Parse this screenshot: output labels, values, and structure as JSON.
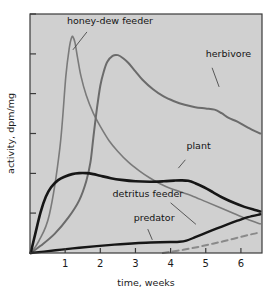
{
  "chart_data": {
    "type": "line",
    "title": "",
    "xlabel": "time, weeks",
    "ylabel": "activity, dpm/mg",
    "xlim": [
      0,
      6.6
    ],
    "ylim": [
      0,
      100
    ],
    "grid": false,
    "legend_position": "inline-annotations",
    "xticks": [
      "1",
      "2",
      "3",
      "4",
      "5",
      "6"
    ],
    "xtick_values": [
      1,
      2,
      3,
      4,
      5,
      6
    ],
    "ytick_values": [
      0,
      16.7,
      33.3,
      50,
      66.7,
      83.3,
      100
    ],
    "yticks": [
      "",
      "",
      "",
      "",
      "",
      "",
      ""
    ],
    "background_color": "#d0d0d0",
    "frame_color": "#3a3a3a",
    "series": [
      {
        "name": "honey-dew feeder",
        "label": "honey-dew feeder",
        "color": "#7a7a7a",
        "style": "solid",
        "width": 1.6,
        "label_x": 1.05,
        "label_y": 96,
        "leader": [
          [
            1.62,
            92.5
          ],
          [
            1.22,
            85.0
          ]
        ],
        "x": [
          0.02,
          0.25,
          0.55,
          0.85,
          1.02,
          1.12,
          1.18,
          1.22,
          1.28,
          1.35,
          1.45,
          1.6,
          1.8,
          2.0,
          2.25,
          2.5,
          2.8,
          3.1,
          3.4,
          3.7,
          4.0,
          4.3,
          4.6,
          5.0,
          5.4,
          5.8,
          6.2,
          6.55
        ],
        "y": [
          0,
          5,
          16,
          44,
          74,
          86,
          90,
          90.5,
          88,
          82,
          74,
          66,
          58.5,
          53,
          47,
          42.5,
          38,
          34.5,
          31.5,
          29,
          27,
          25.5,
          24,
          21.5,
          19,
          16.5,
          14,
          12.2
        ]
      },
      {
        "name": "herbivore",
        "label": "herbivore",
        "color": "#6b6b6b",
        "style": "solid",
        "width": 2.0,
        "label_x": 5.0,
        "label_y": 82,
        "leader": [
          [
            5.18,
            77.5
          ],
          [
            5.38,
            69.5
          ]
        ],
        "x": [
          0.02,
          0.3,
          0.7,
          1.1,
          1.4,
          1.6,
          1.72,
          1.8,
          1.9,
          2.0,
          2.1,
          2.2,
          2.35,
          2.5,
          2.65,
          2.8,
          3.0,
          3.2,
          3.5,
          3.8,
          4.1,
          4.4,
          4.7,
          5.0,
          5.25,
          5.45,
          5.65,
          5.9,
          6.2,
          6.55
        ],
        "y": [
          0,
          3,
          8,
          15,
          22,
          30,
          38,
          48,
          60,
          70,
          76,
          80,
          82.5,
          82.8,
          81.5,
          79.5,
          76,
          72.5,
          68.5,
          65.5,
          63.5,
          62,
          61,
          60.5,
          60,
          58.5,
          56.5,
          55,
          52.5,
          50
        ]
      },
      {
        "name": "plant",
        "label": "plant",
        "color": "#161616",
        "style": "solid",
        "width": 2.6,
        "label_x": 4.45,
        "label_y": 43.5,
        "leader": [
          [
            4.42,
            39.0
          ],
          [
            4.22,
            35.5
          ]
        ],
        "x": [
          0.02,
          0.15,
          0.3,
          0.45,
          0.6,
          0.8,
          1.0,
          1.2,
          1.4,
          1.6,
          1.8,
          2.0,
          2.3,
          2.6,
          3.0,
          3.4,
          3.8,
          4.1,
          4.3,
          4.5,
          4.7,
          4.95,
          5.2,
          5.5,
          5.8,
          6.1,
          6.4,
          6.55
        ],
        "y": [
          0,
          8,
          17,
          23.5,
          27.5,
          30.5,
          32,
          33,
          33.4,
          33.4,
          33,
          32.3,
          31.3,
          30.6,
          30.0,
          29.8,
          30.0,
          30.3,
          30.4,
          30.2,
          29.2,
          27.5,
          25.5,
          23.0,
          21.0,
          19.3,
          18.0,
          17.4
        ]
      },
      {
        "name": "detritus feeder",
        "label": "detritus feeder",
        "color": "#8a8a8a",
        "style": "dashed",
        "width": 2.0,
        "dash": "6,4",
        "label_x": 2.35,
        "label_y": 23.5,
        "leader": [
          [
            4.0,
            21.0
          ],
          [
            4.72,
            12.0
          ]
        ],
        "x": [
          3.78,
          4.0,
          4.3,
          4.6,
          4.9,
          5.2,
          5.5,
          5.8,
          6.1,
          6.35,
          6.55
        ],
        "y": [
          0.0,
          0.5,
          1.2,
          2.0,
          2.9,
          3.9,
          4.9,
          6.0,
          7.1,
          8.0,
          8.6
        ]
      },
      {
        "name": "predator",
        "label": "predator",
        "color": "#161616",
        "style": "solid",
        "width": 2.4,
        "label_x": 2.95,
        "label_y": 13.5,
        "leader": [
          [
            3.35,
            10.0
          ],
          [
            3.48,
            5.5
          ]
        ],
        "x": [
          0.02,
          0.4,
          0.9,
          1.4,
          1.9,
          2.4,
          2.9,
          3.3,
          3.7,
          4.0,
          4.25,
          4.45,
          4.7,
          5.0,
          5.3,
          5.6,
          5.9,
          6.2,
          6.55
        ],
        "y": [
          0,
          0.6,
          1.4,
          2.2,
          2.9,
          3.5,
          4.0,
          4.3,
          4.5,
          4.6,
          4.7,
          5.2,
          6.6,
          8.4,
          10.2,
          11.9,
          13.5,
          15.0,
          16.2
        ]
      }
    ]
  }
}
